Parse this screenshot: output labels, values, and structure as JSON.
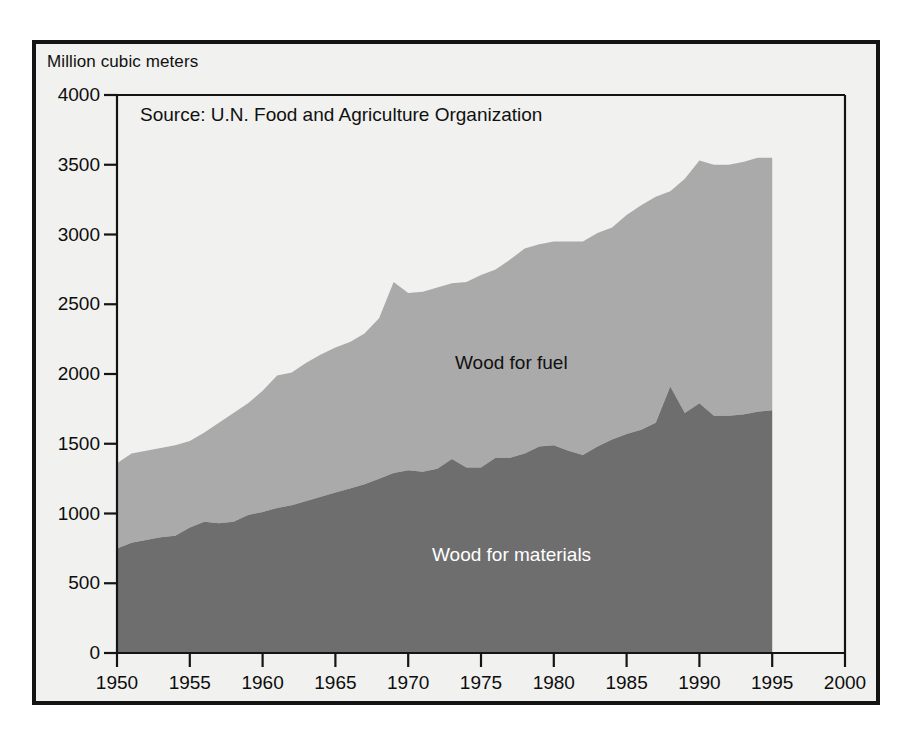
{
  "figure": {
    "units_label": "Million cubic meters",
    "source_note": "Source: U.N. Food and Agriculture Organization"
  },
  "chart_data": {
    "type": "area",
    "stacked": true,
    "title": "",
    "subtitle": "",
    "xlabel": "",
    "ylabel": "Million cubic meters",
    "xlim": [
      1950,
      2000
    ],
    "ylim": [
      0,
      4000
    ],
    "xticks": [
      1950,
      1955,
      1960,
      1965,
      1970,
      1975,
      1980,
      1985,
      1990,
      1995,
      2000
    ],
    "yticks": [
      0,
      500,
      1000,
      1500,
      2000,
      2500,
      3000,
      3500,
      4000
    ],
    "grid": false,
    "legend": "in-plot annotations",
    "annotations": [
      {
        "text": "Wood for fuel",
        "x": 1974,
        "y": 2000,
        "color": "#111111"
      },
      {
        "text": "Wood for materials",
        "x": 1972,
        "y": 700,
        "color": "#ffffff"
      },
      {
        "text": "Source: U.N. Food and Agriculture Organization",
        "x": 1952,
        "y": 3820,
        "color": "#101010"
      }
    ],
    "colors": {
      "wood_for_materials": "#6e6e6e",
      "wood_for_fuel": "#aaaaaa",
      "plot_background": "#f1f1ef",
      "frame": "#141414",
      "axis": "#101010"
    },
    "x": [
      1950,
      1951,
      1952,
      1953,
      1954,
      1955,
      1956,
      1957,
      1958,
      1959,
      1960,
      1961,
      1962,
      1963,
      1964,
      1965,
      1966,
      1967,
      1968,
      1969,
      1970,
      1971,
      1972,
      1973,
      1974,
      1975,
      1976,
      1977,
      1978,
      1979,
      1980,
      1981,
      1982,
      1983,
      1984,
      1985,
      1986,
      1987,
      1988,
      1989,
      1990,
      1991,
      1992,
      1993,
      1994,
      1995
    ],
    "series": [
      {
        "name": "Wood for materials",
        "color": "#6e6e6e",
        "values": [
          750,
          790,
          810,
          830,
          840,
          900,
          940,
          930,
          940,
          990,
          1010,
          1040,
          1060,
          1090,
          1120,
          1150,
          1180,
          1210,
          1250,
          1290,
          1310,
          1300,
          1320,
          1390,
          1330,
          1330,
          1400,
          1400,
          1430,
          1480,
          1490,
          1450,
          1420,
          1480,
          1530,
          1570,
          1600,
          1650,
          1910,
          1720,
          1790,
          1700,
          1700,
          1710,
          1730,
          1740
        ]
      },
      {
        "name": "Wood for fuel",
        "color": "#aaaaaa",
        "values": [
          610,
          640,
          640,
          640,
          650,
          620,
          640,
          720,
          780,
          800,
          870,
          950,
          950,
          990,
          1020,
          1040,
          1050,
          1080,
          1150,
          1370,
          1270,
          1290,
          1300,
          1260,
          1330,
          1380,
          1350,
          1420,
          1470,
          1450,
          1460,
          1500,
          1530,
          1530,
          1520,
          1570,
          1610,
          1620,
          1400,
          1680,
          1740,
          1800,
          1800,
          1810,
          1820,
          1810
        ]
      }
    ],
    "totals": [
      1360,
      1430,
      1450,
      1470,
      1490,
      1520,
      1580,
      1650,
      1720,
      1790,
      1880,
      1990,
      2010,
      2080,
      2140,
      2190,
      2230,
      2290,
      2400,
      2660,
      2580,
      2590,
      2620,
      2650,
      2660,
      2710,
      2750,
      2820,
      2900,
      2930,
      2950,
      2950,
      2950,
      3010,
      3050,
      3140,
      3210,
      3270,
      3310,
      3400,
      3530,
      3500,
      3500,
      3520,
      3550,
      3550
    ]
  }
}
